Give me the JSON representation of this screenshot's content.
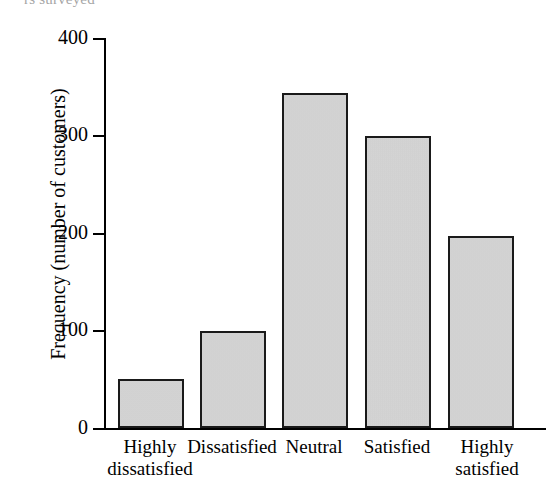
{
  "top_caption": "rs surveyed",
  "chart_data": {
    "type": "bar",
    "title": "",
    "xlabel": "",
    "ylabel": "Frequency (number of customers)",
    "categories": [
      "Highly\ndissatisfied",
      "Dissatisfied",
      "Neutral",
      "Satisfied",
      "Highly\nsatisfied"
    ],
    "values": [
      50,
      100,
      344,
      299,
      197
    ],
    "ylim": [
      0,
      400
    ],
    "ytick_labels": [
      "400",
      "300",
      "200",
      "100",
      "0"
    ],
    "ytick_values": [
      400,
      300,
      200,
      100,
      0
    ],
    "grid": false,
    "legend": false,
    "bar_fill_color": "#d3d3d3",
    "bar_edge_color": "#1a1a1a",
    "axis_color": "#000000",
    "background_color": "#ffffff"
  }
}
